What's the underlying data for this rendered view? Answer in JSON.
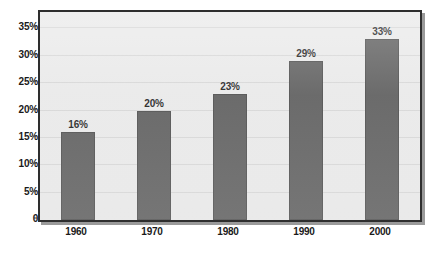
{
  "chart_data": {
    "type": "bar",
    "title": "",
    "subtitle": "",
    "xlabel": "",
    "ylabel": "",
    "categories": [
      "1960",
      "1970",
      "1980",
      "1990",
      "2000"
    ],
    "values": [
      16,
      20,
      23,
      29,
      33
    ],
    "data_labels": [
      "16%",
      "20%",
      "23%",
      "29%",
      "33%"
    ],
    "ylim": [
      0,
      38
    ],
    "ytick_values": [
      0,
      5,
      10,
      15,
      20,
      25,
      30,
      35
    ],
    "ytick_labels": [
      "0",
      "5%",
      "10%",
      "15%",
      "20%",
      "25%",
      "30%",
      "35%"
    ],
    "grid": true,
    "grid_axis": "y",
    "legend": false,
    "legend_position": "none",
    "colors": {
      "bar_fill": "#5b5b5b",
      "bar_edge": "#4a4a4a",
      "plot_background": "#e9e9e9",
      "frame_border": "#2e2e2e",
      "gridline": "#d6d6d6",
      "text": "#1a1a1a",
      "page_background": "#ffffff",
      "frame_shadow": "#9a9a9a"
    }
  }
}
